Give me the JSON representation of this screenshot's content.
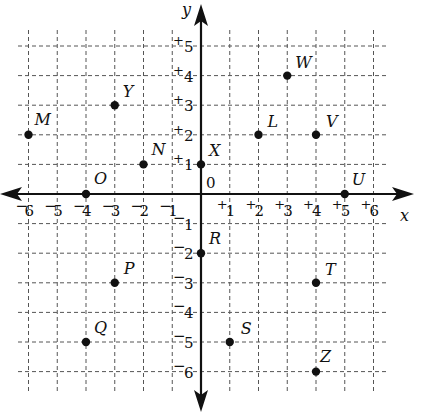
{
  "diagram": {
    "type": "coordinate_plane",
    "axes": {
      "x_label": "x",
      "y_label": "y",
      "origin_label": "0",
      "x_range": [
        -6,
        6
      ],
      "y_range": [
        -6,
        5
      ],
      "x_ticks": [
        {
          "value": -6,
          "sign": "−",
          "num": "6"
        },
        {
          "value": -5,
          "sign": "−",
          "num": "5"
        },
        {
          "value": -4,
          "sign": "−",
          "num": "4"
        },
        {
          "value": -3,
          "sign": "−",
          "num": "3"
        },
        {
          "value": -2,
          "sign": "−",
          "num": "2"
        },
        {
          "value": -1,
          "sign": "−",
          "num": "1"
        },
        {
          "value": 1,
          "sign": "+",
          "num": "1"
        },
        {
          "value": 2,
          "sign": "+",
          "num": "2"
        },
        {
          "value": 3,
          "sign": "+",
          "num": "3"
        },
        {
          "value": 4,
          "sign": "+",
          "num": "4"
        },
        {
          "value": 5,
          "sign": "+",
          "num": "5"
        },
        {
          "value": 6,
          "sign": "+",
          "num": "6"
        }
      ],
      "y_ticks": [
        {
          "value": 5,
          "sign": "+",
          "num": "5"
        },
        {
          "value": 4,
          "sign": "+",
          "num": "4"
        },
        {
          "value": 3,
          "sign": "+",
          "num": "3"
        },
        {
          "value": 2,
          "sign": "+",
          "num": "2"
        },
        {
          "value": 1,
          "sign": "+",
          "num": "1"
        },
        {
          "value": -1,
          "sign": "−",
          "num": "1"
        },
        {
          "value": -2,
          "sign": "−",
          "num": "2"
        },
        {
          "value": -3,
          "sign": "−",
          "num": "3"
        },
        {
          "value": -4,
          "sign": "−",
          "num": "4"
        },
        {
          "value": -5,
          "sign": "−",
          "num": "5"
        },
        {
          "value": -6,
          "sign": "−",
          "num": "6"
        }
      ]
    },
    "grid": {
      "style": "dashed",
      "color": "#555555"
    },
    "points": [
      {
        "label": "M",
        "x": -6,
        "y": 2
      },
      {
        "label": "Y",
        "x": -3,
        "y": 3
      },
      {
        "label": "N",
        "x": -2,
        "y": 1
      },
      {
        "label": "O",
        "x": -4,
        "y": 0
      },
      {
        "label": "X",
        "x": 0,
        "y": 1
      },
      {
        "label": "W",
        "x": 3,
        "y": 4
      },
      {
        "label": "L",
        "x": 2,
        "y": 2
      },
      {
        "label": "V",
        "x": 4,
        "y": 2
      },
      {
        "label": "U",
        "x": 5,
        "y": 0
      },
      {
        "label": "R",
        "x": 0,
        "y": -2
      },
      {
        "label": "P",
        "x": -3,
        "y": -3
      },
      {
        "label": "T",
        "x": 4,
        "y": -3
      },
      {
        "label": "Q",
        "x": -4,
        "y": -5
      },
      {
        "label": "S",
        "x": 1,
        "y": -5
      },
      {
        "label": "Z",
        "x": 4,
        "y": -6
      }
    ]
  }
}
